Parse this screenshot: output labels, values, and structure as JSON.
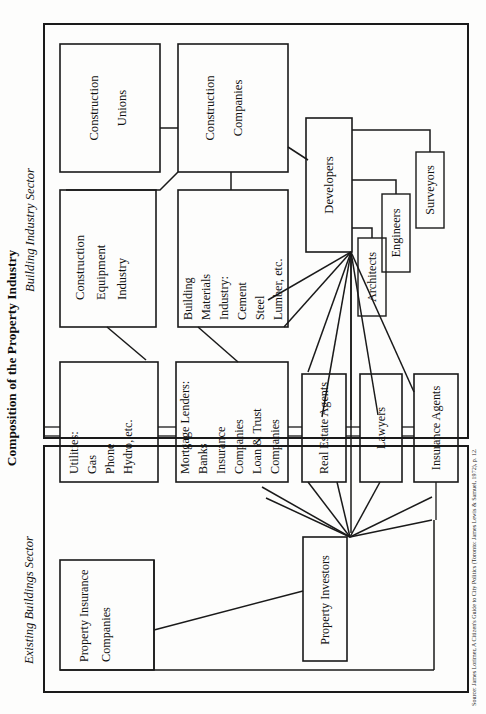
{
  "figure": {
    "title": "Composition of the Property Industry",
    "source": "Source: James Lorimer, A Citizen's Guide to City Politics (Toronto: James Lewis & Samuel, 1972), p. 12. Reproduced by permission."
  },
  "sectors": [
    {
      "id": "building-industry",
      "label": "Building Industry Sector"
    },
    {
      "id": "existing-buildings",
      "label": "Existing Buildings Sector"
    }
  ],
  "nodes": [
    {
      "id": "construction-unions",
      "lines": [
        "Construction",
        "Unions"
      ]
    },
    {
      "id": "construction-companies",
      "lines": [
        "Construction",
        "Companies"
      ]
    },
    {
      "id": "construction-equipment",
      "lines": [
        "Construction",
        "Equipment",
        "Industry"
      ]
    },
    {
      "id": "building-materials",
      "lines": [
        "Building",
        "Materials",
        "Industry:",
        "Cement",
        "Steel",
        "Lumber, etc."
      ]
    },
    {
      "id": "developers",
      "lines": [
        "Developers"
      ]
    },
    {
      "id": "architects",
      "lines": [
        "Architects"
      ]
    },
    {
      "id": "engineers",
      "lines": [
        "Engineers"
      ]
    },
    {
      "id": "surveyors",
      "lines": [
        "Surveyors"
      ]
    },
    {
      "id": "utilities",
      "lines": [
        "Utilities:",
        "Gas",
        "Phone",
        "Hydro, etc."
      ]
    },
    {
      "id": "mortgage-lenders",
      "lines": [
        "Mortgage Lenders:",
        "Banks",
        "Insurance",
        "Companies",
        "Loan & Trust",
        "Companies"
      ]
    },
    {
      "id": "real-estate-agents",
      "lines": [
        "Real Estate Agents"
      ]
    },
    {
      "id": "lawyers",
      "lines": [
        "Lawyers"
      ]
    },
    {
      "id": "insurance-agents",
      "lines": [
        "Insurance Agents"
      ]
    },
    {
      "id": "property-insurance",
      "lines": [
        "Property Insurance",
        "Companies"
      ]
    },
    {
      "id": "property-investors",
      "lines": [
        "Property Investors"
      ]
    }
  ],
  "text": {
    "construction_unions_1": "Construction",
    "construction_unions_2": "Unions",
    "construction_companies_1": "Construction",
    "construction_companies_2": "Companies",
    "construction_equipment_1": "Construction",
    "construction_equipment_2": "Equipment",
    "construction_equipment_3": "Industry",
    "building_materials_1": "Building",
    "building_materials_2": "Materials",
    "building_materials_3": "Industry:",
    "building_materials_4": "Cement",
    "building_materials_5": "Steel",
    "building_materials_6": "Lumber, etc.",
    "developers": "Developers",
    "architects": "Architects",
    "engineers": "Engineers",
    "surveyors": "Surveyors",
    "utilities_1": "Utilities:",
    "utilities_2": "Gas",
    "utilities_3": "Phone",
    "utilities_4": "Hydro, etc.",
    "lenders_1": "Mortgage Lenders:",
    "lenders_2": "Banks",
    "lenders_3": "Insurance",
    "lenders_4": "Companies",
    "lenders_5": "Loan & Trust",
    "lenders_6": "Companies",
    "real_estate_agents": "Real Estate Agents",
    "lawyers": "Lawyers",
    "insurance_agents": "Insurance Agents",
    "property_insurance_1": "Property Insurance",
    "property_insurance_2": "Companies",
    "property_investors": "Property Investors",
    "sector_building": "Building Industry Sector",
    "sector_existing": "Existing Buildings Sector",
    "title": "Composition of the Property Industry",
    "source": "Source: James Lorimer, A Citizen's Guide to City Politics (Toronto: James Lewis & Samuel, 1972), p. 12."
  },
  "colors": {
    "ink": "#1a1a1a",
    "paper": "#fdfdfc"
  }
}
